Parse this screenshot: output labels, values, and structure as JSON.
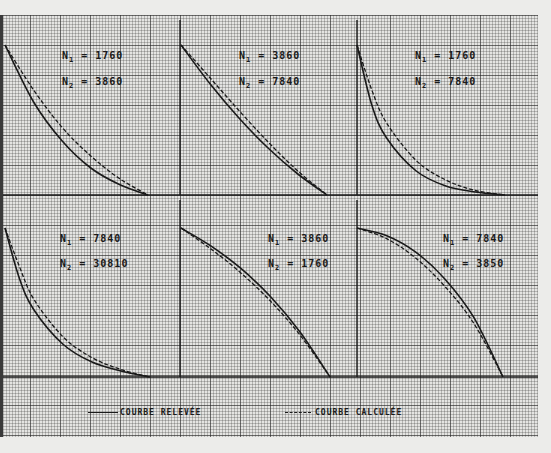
{
  "chart_data": {
    "type": "line",
    "title": "",
    "layout": {
      "rows": 2,
      "cols": 3,
      "grid": true,
      "background": "graph paper"
    },
    "legend": [
      {
        "label": "COURBE RELEVÉE",
        "style": "solid"
      },
      {
        "label": "COURBE CALCULÉE",
        "style": "dashed"
      }
    ],
    "panels": [
      {
        "id": "p1",
        "row": 1,
        "col": 1,
        "N1": "1760",
        "N2": "3860",
        "shape": "convex-decreasing",
        "series": [
          {
            "name": "COURBE RELEVÉE",
            "x": [
              0,
              0.2,
              0.4,
              0.6,
              0.8,
              1.0
            ],
            "y": [
              1.0,
              0.62,
              0.36,
              0.18,
              0.07,
              0.0
            ]
          },
          {
            "name": "COURBE CALCULÉE",
            "x": [
              0,
              0.2,
              0.4,
              0.6,
              0.8,
              1.0
            ],
            "y": [
              1.0,
              0.7,
              0.45,
              0.26,
              0.11,
              0.0
            ]
          }
        ]
      },
      {
        "id": "p2",
        "row": 1,
        "col": 2,
        "N1": "3860",
        "N2": "7840",
        "shape": "near-linear-decreasing",
        "series": [
          {
            "name": "COURBE RELEVÉE",
            "x": [
              0,
              0.2,
              0.4,
              0.6,
              0.8,
              1.0
            ],
            "y": [
              1.0,
              0.74,
              0.51,
              0.31,
              0.14,
              0.0
            ]
          },
          {
            "name": "COURBE CALCULÉE",
            "x": [
              0,
              0.2,
              0.4,
              0.6,
              0.8,
              1.0
            ],
            "y": [
              1.0,
              0.78,
              0.56,
              0.35,
              0.16,
              0.0
            ]
          }
        ]
      },
      {
        "id": "p3",
        "row": 1,
        "col": 3,
        "N1": "1760",
        "N2": "7840",
        "shape": "strongly-convex-decreasing",
        "series": [
          {
            "name": "COURBE RELEVÉE",
            "x": [
              0,
              0.1,
              0.2,
              0.4,
              0.6,
              0.8,
              1.0
            ],
            "y": [
              1.0,
              0.6,
              0.38,
              0.16,
              0.06,
              0.02,
              0.0
            ]
          },
          {
            "name": "COURBE CALCULÉE",
            "x": [
              0,
              0.1,
              0.2,
              0.4,
              0.6,
              0.8,
              1.0
            ],
            "y": [
              1.0,
              0.7,
              0.48,
              0.23,
              0.1,
              0.03,
              0.0
            ]
          }
        ]
      },
      {
        "id": "p4",
        "row": 2,
        "col": 1,
        "N1": "7840",
        "N2": "30810",
        "shape": "strongly-convex-decreasing",
        "series": [
          {
            "name": "COURBE RELEVÉE",
            "x": [
              0,
              0.1,
              0.2,
              0.4,
              0.6,
              0.8,
              1.0
            ],
            "y": [
              1.0,
              0.66,
              0.45,
              0.22,
              0.1,
              0.04,
              0.0
            ]
          },
          {
            "name": "COURBE CALCULÉE",
            "x": [
              0,
              0.1,
              0.2,
              0.4,
              0.6,
              0.8,
              1.0
            ],
            "y": [
              1.0,
              0.74,
              0.52,
              0.27,
              0.13,
              0.05,
              0.0
            ]
          }
        ]
      },
      {
        "id": "p5",
        "row": 2,
        "col": 2,
        "N1": "3860",
        "N2": "1760",
        "shape": "concave-decreasing",
        "series": [
          {
            "name": "COURBE RELEVÉE",
            "x": [
              0,
              0.2,
              0.4,
              0.6,
              0.8,
              1.0
            ],
            "y": [
              1.0,
              0.88,
              0.73,
              0.54,
              0.3,
              0.0
            ]
          },
          {
            "name": "COURBE CALCULÉE",
            "x": [
              0,
              0.2,
              0.4,
              0.6,
              0.8,
              1.0
            ],
            "y": [
              1.0,
              0.86,
              0.7,
              0.51,
              0.28,
              0.0
            ]
          }
        ]
      },
      {
        "id": "p6",
        "row": 2,
        "col": 3,
        "N1": "7840",
        "N2": "3850",
        "shape": "strongly-concave-decreasing",
        "series": [
          {
            "name": "COURBE RELEVÉE",
            "x": [
              0,
              0.2,
              0.4,
              0.6,
              0.8,
              1.0
            ],
            "y": [
              1.0,
              0.95,
              0.84,
              0.66,
              0.4,
              0.0
            ]
          },
          {
            "name": "COURBE CALCULÉE",
            "x": [
              0,
              0.2,
              0.4,
              0.6,
              0.8,
              1.0
            ],
            "y": [
              1.0,
              0.93,
              0.8,
              0.61,
              0.36,
              0.0
            ]
          }
        ]
      }
    ],
    "xlabel": "",
    "ylabel": "",
    "xlim": [
      0,
      1
    ],
    "ylim": [
      0,
      1
    ]
  },
  "labels": {
    "n1_prefix": "N",
    "n2_prefix": "N",
    "sub1": "1",
    "sub2": "2",
    "equals": " = "
  },
  "legend": {
    "measured": "COURBE RELEVÉE",
    "calculated": "COURBE CALCULÉE"
  },
  "colors": {
    "ink": "#1a1a1a",
    "paper": "#e4e4e2",
    "grid": "#3a3a3a"
  }
}
